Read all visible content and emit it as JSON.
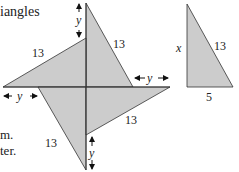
{
  "text_fragments": {
    "top": "iangles",
    "mid": "m.",
    "bottom": "ter."
  },
  "figure": {
    "fill_color": "#cccccc",
    "stroke_color": "#333333",
    "labels": {
      "hyp_top": "13",
      "hyp_left": "13",
      "hyp_bottom": "13",
      "hyp_right": "13",
      "gap_top": "y",
      "gap_left": "y",
      "gap_right": "y",
      "gap_bottom": "y"
    }
  },
  "reference_triangle": {
    "side_vertical": "x",
    "hypotenuse": "13",
    "base": "5"
  }
}
